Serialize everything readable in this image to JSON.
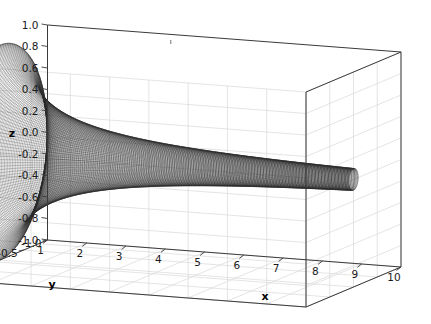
{
  "figure": {
    "kind": "3d-surface-wireframe",
    "background_color": "#ffffff",
    "pane_color": "#ffffff",
    "grid_color": "#d8d8d8",
    "axis_line_color": "#3a3a3a",
    "mesh_color": "#2b2b2b",
    "width": 431,
    "height": 324
  },
  "axes": {
    "x": {
      "label": "x",
      "ticks": [
        "1",
        "2",
        "3",
        "4",
        "5",
        "6",
        "7",
        "8",
        "9",
        "10"
      ],
      "range": [
        1,
        10
      ]
    },
    "y": {
      "label": "y",
      "ticks": [
        "1.0",
        "0.5",
        "0.0",
        "-0.5",
        "-1.0"
      ],
      "range": [
        -1,
        1
      ]
    },
    "z": {
      "label": "z",
      "ticks": [
        "1.0",
        "0.8",
        "0.6",
        "0.4",
        "0.2",
        "0.0",
        "-0.2",
        "-0.4",
        "-0.6",
        "-0.8",
        "-1.0"
      ],
      "range": [
        -1,
        1
      ]
    }
  },
  "chart_data": {
    "type": "line",
    "title": "",
    "xlabel": "x",
    "ylabel": "y",
    "zlabel": "z",
    "surface": "Gabriel's horn: surface of revolution of r = 1/x about the x-axis",
    "equations": {
      "radius": "r(x) = 1/x",
      "y": "y(x,t) = (1/x) * cos(t)",
      "z": "z(x,t) = (1/x) * sin(t)"
    },
    "xlim": [
      1,
      10
    ],
    "ylim": [
      -1,
      1
    ],
    "zlim": [
      -1,
      1
    ],
    "grid": true,
    "legend": "none",
    "x": [
      1,
      1.5,
      2,
      2.5,
      3,
      3.5,
      4,
      4.5,
      5,
      5.5,
      6,
      6.5,
      7,
      7.5,
      8,
      8.5,
      9,
      9.5,
      10
    ],
    "radius": [
      1.0,
      0.667,
      0.5,
      0.4,
      0.333,
      0.286,
      0.25,
      0.222,
      0.2,
      0.182,
      0.167,
      0.154,
      0.143,
      0.133,
      0.125,
      0.118,
      0.111,
      0.105,
      0.1
    ],
    "mesh": {
      "x_divisions": 160,
      "theta_divisions": 120,
      "style": "wireframe"
    },
    "view": {
      "elevation_deg": 18,
      "azimuth_deg": -62
    }
  }
}
